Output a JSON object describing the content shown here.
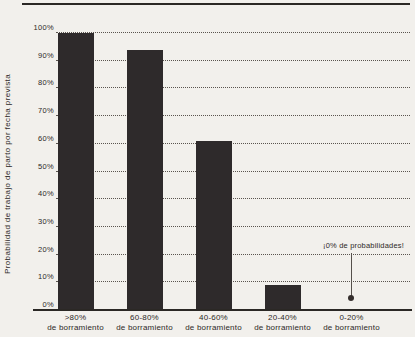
{
  "colors": {
    "background": "#f2f0ec",
    "bar": "#2e2a2b",
    "text": "#2d2927",
    "grid": "#5a544f",
    "axis": "#2b2825",
    "annotation_line": "#55504b",
    "annotation_dot": "#352e2d"
  },
  "chart_data": {
    "type": "bar",
    "title": "",
    "categories": [
      ">80% de borramiento",
      "60-80% de borramiento",
      "40-60% de borramiento",
      "20-40% de borramiento",
      "0-20% de borramiento"
    ],
    "categories_line1": [
      ">80%",
      "60-80%",
      "40-60%",
      "20-40%",
      "0-20%"
    ],
    "categories_line2": "de borramiento",
    "values": [
      100,
      94,
      61,
      9,
      0
    ],
    "xlabel": "",
    "ylabel": "Probabilidad de trabajo de parto por fecha prevista",
    "ylim": [
      0,
      100
    ],
    "y_tick_values": [
      0,
      10,
      20,
      30,
      40,
      50,
      60,
      70,
      80,
      90,
      100
    ],
    "y_tick_labels": [
      "0%",
      "10%",
      "20%",
      "30%",
      "40%",
      "50%",
      "60%",
      "70%",
      "80%",
      "90%",
      "100%"
    ],
    "grid": "dotted-horizontal",
    "legend": "none",
    "annotation": {
      "text": "¡0% de probabilidades!",
      "category": "0-20% de borramiento",
      "value": 0
    }
  }
}
